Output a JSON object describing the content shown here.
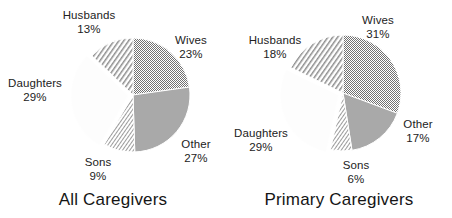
{
  "figure": {
    "background_color": "#ffffff",
    "text_color": "#222222"
  },
  "chart_data": [
    {
      "type": "pie",
      "title": "All Caregivers",
      "xlabel": "",
      "ylabel": "",
      "legend": "none",
      "grid": false,
      "value_unit": "%",
      "categories": [
        "Wives",
        "Other",
        "Sons",
        "Daughters",
        "Husbands"
      ],
      "values": [
        23,
        27,
        9,
        29,
        13
      ],
      "labels": [
        "23%",
        "27%",
        "9%",
        "29%",
        "13%"
      ],
      "start_angle_deg": 0,
      "direction": "clockwise",
      "exploded_slice": "Daughters",
      "slices": [
        {
          "name": "Wives",
          "value": 23,
          "label": "23%",
          "fill": "dotted",
          "color": "#9a9a9a"
        },
        {
          "name": "Other",
          "value": 27,
          "label": "27%",
          "fill": "solid",
          "color": "#a8a8a8"
        },
        {
          "name": "Sons",
          "value": 9,
          "label": "9%",
          "fill": "hatch-fine",
          "color": "#b4b4b4"
        },
        {
          "name": "Daughters",
          "value": 29,
          "label": "29%",
          "fill": "blank",
          "color": "#fbfbfb"
        },
        {
          "name": "Husbands",
          "value": 13,
          "label": "13%",
          "fill": "hatch-coarse",
          "color": "#aaaaaa"
        }
      ]
    },
    {
      "type": "pie",
      "title": "Primary Caregivers",
      "xlabel": "",
      "ylabel": "",
      "legend": "none",
      "grid": false,
      "value_unit": "%",
      "categories": [
        "Wives",
        "Other",
        "Sons",
        "Daughters",
        "Husbands"
      ],
      "values": [
        31,
        17,
        6,
        29,
        18
      ],
      "labels": [
        "31%",
        "17%",
        "6%",
        "29%",
        "18%"
      ],
      "start_angle_deg": 0,
      "direction": "clockwise",
      "exploded_slice": "Daughters",
      "slices": [
        {
          "name": "Wives",
          "value": 31,
          "label": "31%",
          "fill": "dotted",
          "color": "#9a9a9a"
        },
        {
          "name": "Other",
          "value": 17,
          "label": "17%",
          "fill": "solid",
          "color": "#a8a8a8"
        },
        {
          "name": "Sons",
          "value": 6,
          "label": "6%",
          "fill": "hatch-fine",
          "color": "#b4b4b4"
        },
        {
          "name": "Daughters",
          "value": 29,
          "label": "29%",
          "fill": "blank",
          "color": "#fbfbfb"
        },
        {
          "name": "Husbands",
          "value": 18,
          "label": "18%",
          "fill": "hatch-coarse",
          "color": "#aaaaaa"
        }
      ]
    }
  ],
  "panels": {
    "all": {
      "title": "All Caregivers",
      "labels": {
        "husbands": {
          "name": "Husbands",
          "pct": "13%"
        },
        "wives": {
          "name": "Wives",
          "pct": "23%"
        },
        "other": {
          "name": "Other",
          "pct": "27%"
        },
        "sons": {
          "name": "Sons",
          "pct": "9%"
        },
        "daughters": {
          "name": "Daughters",
          "pct": "29%"
        }
      }
    },
    "primary": {
      "title": "Primary Caregivers",
      "labels": {
        "husbands": {
          "name": "Husbands",
          "pct": "18%"
        },
        "wives": {
          "name": "Wives",
          "pct": "31%"
        },
        "other": {
          "name": "Other",
          "pct": "17%"
        },
        "sons": {
          "name": "Sons",
          "pct": "6%"
        },
        "daughters": {
          "name": "Daughters",
          "pct": "29%"
        }
      }
    }
  }
}
